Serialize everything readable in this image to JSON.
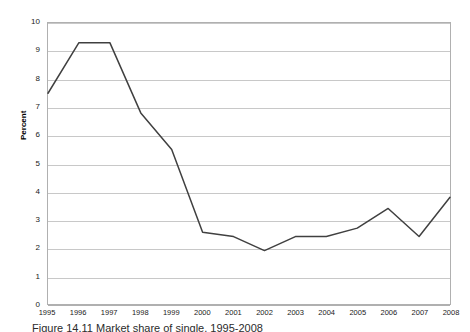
{
  "chart_data": {
    "type": "line",
    "title": "",
    "xlabel": "",
    "ylabel": "Percent",
    "x": [
      1995,
      1996,
      1997,
      1998,
      1999,
      2000,
      2001,
      2002,
      2003,
      2004,
      2005,
      2006,
      2007,
      2008
    ],
    "categories": [
      "1995",
      "1996",
      "1997",
      "1998",
      "1999",
      "2000",
      "2001",
      "2002",
      "2003",
      "2004",
      "2005",
      "2006",
      "2007",
      "2008"
    ],
    "values": [
      7.5,
      9.3,
      9.3,
      6.8,
      5.5,
      2.55,
      2.4,
      1.9,
      2.4,
      2.4,
      2.7,
      3.4,
      2.4,
      3.8
    ],
    "series": [
      {
        "name": "Percent",
        "values": [
          7.5,
          9.3,
          9.3,
          6.8,
          5.5,
          2.55,
          2.4,
          1.9,
          2.4,
          2.4,
          2.7,
          3.4,
          2.4,
          3.8
        ]
      }
    ],
    "ylim": [
      0,
      10
    ],
    "yticks": [
      0,
      1,
      2,
      3,
      4,
      5,
      6,
      7,
      8,
      9,
      10
    ],
    "ytick_labels": [
      "0",
      "1",
      "2",
      "3",
      "4",
      "5",
      "6",
      "7",
      "8",
      "9",
      "10"
    ],
    "grid": "horizontal",
    "legend": "none",
    "markers": false,
    "line_color": "#404040",
    "grid_color": "#c8c8c8",
    "border_color": "#b0b0b0",
    "background": "#ffffff"
  },
  "caption": {
    "text": "Figure 14.11 Market share of single, 1995-2008"
  }
}
